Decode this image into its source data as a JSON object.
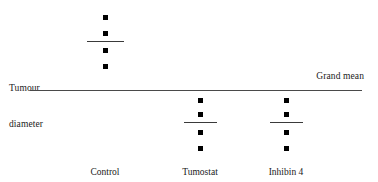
{
  "figure": {
    "y_axis_label_line1": "Tumour",
    "y_axis_label_line2": "diameter",
    "grand_mean_label": "Grand mean"
  },
  "chart_data": {
    "type": "scatter",
    "title": "",
    "xlabel": "",
    "ylabel": "Tumour diameter",
    "categories": [
      "Control",
      "Tumostat",
      "Inhibin 4"
    ],
    "grid": false,
    "legend": "none",
    "annotations": [
      "Tumour diameter",
      "Grand mean"
    ],
    "grand_mean": {
      "label": "Grand mean",
      "y_px": 90,
      "x_start_px": 30,
      "x_end_px": 362
    },
    "series": [
      {
        "name": "Control",
        "x_px": 105,
        "label_y_px": 166,
        "points_y_px": [
          17,
          33,
          50,
          66
        ],
        "mean_y_px": 41,
        "mean_line_width_px": 37
      },
      {
        "name": "Tumostat",
        "x_px": 200,
        "label_y_px": 166,
        "points_y_px": [
          100,
          114,
          132,
          148
        ],
        "mean_y_px": 122,
        "mean_line_width_px": 33
      },
      {
        "name": "Inhibin 4",
        "x_px": 286,
        "label_y_px": 166,
        "points_y_px": [
          100,
          114,
          132,
          148
        ],
        "mean_y_px": 122,
        "mean_line_width_px": 33
      }
    ]
  },
  "colors": {
    "point": "#000000",
    "line": "#3a3a3a",
    "grand_mean_line": "#4a4a4a",
    "text": "#1a1a1a",
    "background": "#ffffff"
  }
}
